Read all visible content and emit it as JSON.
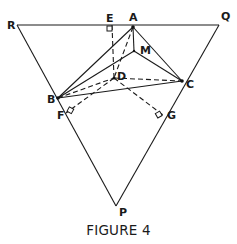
{
  "caption": "FIGURE 4",
  "labels": {
    "R": "R",
    "Q": "Q",
    "P": "P",
    "A": "A",
    "E": "E",
    "M": "M",
    "D": "D",
    "B": "B",
    "C": "C",
    "F": "F",
    "G": "G"
  },
  "points": {
    "R": [
      17,
      25
    ],
    "Q": [
      219,
      25
    ],
    "P": [
      116,
      206
    ],
    "A": [
      133,
      27
    ],
    "E": [
      112,
      25
    ],
    "M": [
      134,
      51
    ],
    "D": [
      114,
      78
    ],
    "B": [
      58,
      98
    ],
    "C": [
      182,
      81
    ],
    "F": [
      66,
      113
    ],
    "G": [
      163,
      115
    ]
  },
  "colors": {
    "ink": "#1a1a1a",
    "background": "#ffffff"
  }
}
